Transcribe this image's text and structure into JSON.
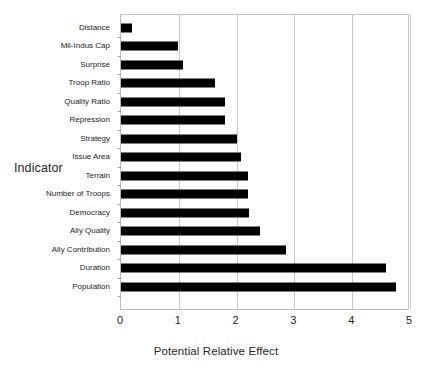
{
  "chart_data": {
    "type": "bar",
    "orientation": "horizontal",
    "title": "",
    "xlabel": "Potential Relative Effect",
    "ylabel": "Indicator",
    "xlim": [
      0,
      5
    ],
    "ylim": null,
    "xticks": [
      0,
      1,
      2,
      3,
      4,
      5
    ],
    "xtick_labels": [
      "0",
      "1",
      "2",
      "3",
      "4",
      "5"
    ],
    "grid": "vertical",
    "legend": null,
    "bar_color": "#000000",
    "categories": [
      "Distance",
      "Mil-Indus Cap",
      "Surprise",
      "Troop Ratio",
      "Quality Ratio",
      "Repression",
      "Strategy",
      "Issue Area",
      "Terrain",
      "Number of Troops",
      "Democracy",
      "Ally Quality",
      "Ally Contribution",
      "Duration",
      "Population"
    ],
    "values": [
      0.19,
      0.98,
      1.08,
      1.62,
      1.8,
      1.8,
      2.0,
      2.08,
      2.2,
      2.2,
      2.22,
      2.4,
      2.86,
      4.58,
      4.75
    ]
  }
}
